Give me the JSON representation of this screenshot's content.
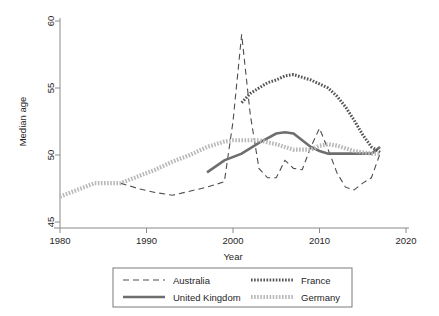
{
  "chart_data": {
    "type": "line",
    "title": "",
    "xlabel": "Year",
    "ylabel": "Median age",
    "xlim": [
      1980,
      2020
    ],
    "ylim": [
      45,
      60
    ],
    "xticks": [
      1980,
      1990,
      2000,
      2010,
      2020
    ],
    "yticks": [
      45,
      50,
      55,
      60
    ],
    "grid": false,
    "legend_position": "bottom",
    "series": [
      {
        "name": "Australia",
        "style": "dashed",
        "color": "#4d4d4d",
        "x": [
          1987,
          1989,
          1991,
          1993,
          1995,
          1997,
          1999,
          2000,
          2001,
          2002,
          2003,
          2004,
          2005,
          2006,
          2007,
          2008,
          2009,
          2010,
          2011,
          2012,
          2013,
          2014,
          2015,
          2016,
          2017
        ],
        "y": [
          47.9,
          47.5,
          47.2,
          47.0,
          47.3,
          47.6,
          48.0,
          52.5,
          59.0,
          53.0,
          49.0,
          48.3,
          48.3,
          49.6,
          49.0,
          48.9,
          50.6,
          52.0,
          50.4,
          48.7,
          47.6,
          47.4,
          47.9,
          48.3,
          50.1
        ]
      },
      {
        "name": "United Kingdom",
        "style": "solid",
        "color": "#6e6e6e",
        "x": [
          1997,
          1999,
          2001,
          2003,
          2005,
          2006,
          2007,
          2008,
          2009,
          2010,
          2011,
          2012,
          2013,
          2014,
          2015,
          2016,
          2017
        ],
        "y": [
          48.7,
          49.6,
          50.1,
          50.9,
          51.6,
          51.7,
          51.6,
          51.1,
          50.6,
          50.3,
          50.1,
          50.1,
          50.1,
          50.1,
          50.1,
          50.1,
          50.6
        ]
      },
      {
        "name": "France",
        "style": "dotted",
        "color": "#555555",
        "x": [
          2001,
          2002,
          2003,
          2004,
          2005,
          2006,
          2007,
          2008,
          2009,
          2010,
          2011,
          2012,
          2013,
          2014,
          2015,
          2016,
          2017
        ],
        "y": [
          53.9,
          54.6,
          55.0,
          55.4,
          55.6,
          55.9,
          56.0,
          55.8,
          55.6,
          55.3,
          55.0,
          54.4,
          53.6,
          52.6,
          51.5,
          50.6,
          50.2
        ]
      },
      {
        "name": "Germany",
        "style": "hatched",
        "color": "#b8b8b8",
        "x": [
          1980,
          1982,
          1984,
          1986,
          1987,
          1989,
          1991,
          1993,
          1995,
          1997,
          1999,
          2000,
          2001,
          2003,
          2005,
          2007,
          2009,
          2010,
          2011,
          2012,
          2013,
          2014,
          2015,
          2016,
          2017
        ],
        "y": [
          46.9,
          47.4,
          47.9,
          47.9,
          47.9,
          48.4,
          48.9,
          49.5,
          50.0,
          50.6,
          51.0,
          51.1,
          51.1,
          51.1,
          50.8,
          50.4,
          50.4,
          50.7,
          50.8,
          50.7,
          50.5,
          50.3,
          50.2,
          50.1,
          50.1
        ]
      }
    ]
  },
  "axes": {
    "y_label": "Median age",
    "x_label": "Year",
    "y_tick_labels": [
      "60",
      "55",
      "50",
      "45"
    ],
    "x_tick_labels": [
      "1980",
      "1990",
      "2000",
      "2010",
      "2020"
    ]
  },
  "legend": {
    "entries": [
      {
        "label": "Australia",
        "style": "dashed",
        "color": "#4d4d4d"
      },
      {
        "label": "France",
        "style": "dotted",
        "color": "#555555"
      },
      {
        "label": "United Kingdom",
        "style": "solid",
        "color": "#6e6e6e"
      },
      {
        "label": "Germany",
        "style": "hatched",
        "color": "#b8b8b8"
      }
    ]
  }
}
